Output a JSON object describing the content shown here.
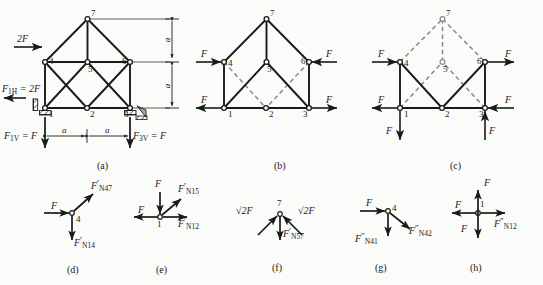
{
  "figure": {
    "background": "#fbfbf9",
    "ink": "#1a1a1a",
    "dashed_color": "#8a8a8a",
    "width": 543,
    "height": 285
  },
  "panels": [
    {
      "id": "a",
      "caption": "(a)"
    },
    {
      "id": "b",
      "caption": "(b)"
    },
    {
      "id": "c",
      "caption": "(c)"
    },
    {
      "id": "d",
      "caption": "(d)"
    },
    {
      "id": "e",
      "caption": "(e)"
    },
    {
      "id": "f",
      "caption": "(f)"
    },
    {
      "id": "g",
      "caption": "(g)"
    },
    {
      "id": "h",
      "caption": "(h)"
    }
  ],
  "panel_a": {
    "caption": "(a)",
    "nodes": [
      "1",
      "2",
      "3",
      "4",
      "5",
      "6",
      "7"
    ],
    "applied_load": "2F",
    "reactions": [
      {
        "name": "F1H",
        "text_main": "F",
        "text_sub": "1H",
        "text_rest": "= 2F"
      },
      {
        "name": "F1V",
        "text_main": "F",
        "text_sub": "1V",
        "text_rest": "= F"
      },
      {
        "name": "F3V",
        "text_main": "F",
        "text_sub": "3V",
        "text_rest": "= F"
      }
    ],
    "dimensions": {
      "horizontal": [
        "a",
        "a"
      ],
      "vertical": [
        "a",
        "a"
      ]
    }
  },
  "panel_b": {
    "caption": "(b)",
    "nodes": [
      "1",
      "2",
      "3",
      "4",
      "5",
      "6",
      "7"
    ],
    "forces": [
      {
        "at": "4",
        "label": "F",
        "dir": "right"
      },
      {
        "at": "6",
        "label": "F",
        "dir": "left"
      },
      {
        "at": "1",
        "label": "F",
        "dir": "left"
      },
      {
        "at": "3",
        "label": "F",
        "dir": "right"
      }
    ]
  },
  "panel_c": {
    "caption": "(c)",
    "nodes": [
      "1",
      "2",
      "3",
      "4",
      "5",
      "6",
      "7"
    ],
    "forces": [
      {
        "at": "4",
        "label": "F",
        "dir": "right"
      },
      {
        "at": "6",
        "label": "F",
        "dir": "right"
      },
      {
        "at": "1",
        "label": "F",
        "dir": "left"
      },
      {
        "at": "3",
        "label": "F",
        "dir": "left"
      },
      {
        "at": "1",
        "label": "F",
        "dir": "down"
      },
      {
        "at": "3",
        "label": "F",
        "dir": "up"
      }
    ]
  },
  "panel_d": {
    "caption": "(d)",
    "node": "4",
    "forces": [
      {
        "label": "F",
        "dir": "right"
      },
      {
        "main": "F",
        "prime": "′",
        "sub": "N47",
        "dir": "up-right"
      },
      {
        "main": "F",
        "prime": "′",
        "sub": "N14",
        "dir": "down"
      }
    ]
  },
  "panel_e": {
    "caption": "(e)",
    "node": "1",
    "forces": [
      {
        "label": "F",
        "dir": "down"
      },
      {
        "label": "F",
        "dir": "left"
      },
      {
        "main": "F",
        "prime": "′",
        "sub": "N15",
        "dir": "up-right"
      },
      {
        "main": "F",
        "prime": "′",
        "sub": "N12",
        "dir": "right"
      }
    ]
  },
  "panel_f": {
    "caption": "(f)",
    "node": "7",
    "forces": [
      {
        "label": "√2F",
        "dir": "down-left"
      },
      {
        "label": "√2F",
        "dir": "down-right"
      },
      {
        "main": "F",
        "prime": "′",
        "sub": "N57",
        "dir": "down"
      }
    ]
  },
  "panel_g": {
    "caption": "(g)",
    "node": "4",
    "forces": [
      {
        "label": "F",
        "dir": "right"
      },
      {
        "main": "F",
        "prime": "″",
        "sub": "N41",
        "dir": "down"
      },
      {
        "main": "F",
        "prime": "″",
        "sub": "N42",
        "dir": "down-right"
      }
    ]
  },
  "panel_h": {
    "caption": "(h)",
    "node": "1",
    "forces": [
      {
        "label": "F",
        "dir": "up"
      },
      {
        "label": "F",
        "dir": "left"
      },
      {
        "label": "F",
        "dir": "down"
      },
      {
        "main": "F",
        "prime": "″",
        "sub": "N12",
        "dir": "right"
      }
    ]
  }
}
